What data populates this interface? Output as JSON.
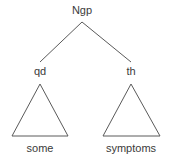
{
  "figure": {
    "kind": "syntax-tree-diagram",
    "width": 172,
    "height": 160,
    "background_color": "#ffffff",
    "line_color": "#5a5a5a",
    "text_color": "#3a3a3a"
  },
  "tree": {
    "root": {
      "label": "Ngp",
      "x": 82,
      "y": 22
    },
    "children": [
      {
        "label": "qd",
        "x": 40,
        "y": 63,
        "triangle": {
          "apex_x": 40,
          "apex_y": 84,
          "base_left_x": 12,
          "base_right_x": 68,
          "base_y": 136
        },
        "leaf": "some"
      },
      {
        "label": "th",
        "x": 131,
        "y": 63,
        "triangle": {
          "apex_x": 131,
          "apex_y": 84,
          "base_left_x": 103,
          "base_right_x": 160,
          "base_y": 136
        },
        "leaf": "symptoms"
      }
    ]
  }
}
